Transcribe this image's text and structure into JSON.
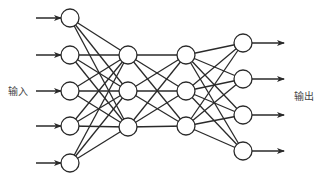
{
  "labels": {
    "input": "输入",
    "output": "输出"
  },
  "colors": {
    "stroke": "#2a2a2a",
    "node_fill": "#ffffff",
    "background": "#ffffff"
  },
  "network": {
    "node_radius": 9,
    "layers": [
      {
        "name": "input",
        "x": 70,
        "y": [
          18,
          55,
          91,
          126,
          163
        ]
      },
      {
        "name": "hidden-1",
        "x": 128,
        "y": [
          55,
          91,
          127
        ]
      },
      {
        "name": "hidden-2",
        "x": 186,
        "y": [
          55,
          91,
          126
        ]
      },
      {
        "name": "output",
        "x": 243,
        "y": [
          43,
          79,
          115,
          151
        ]
      }
    ],
    "input_arrows": {
      "x_start": 36,
      "x_end": 61
    },
    "output_arrows": {
      "x_start": 252,
      "x_end": 284
    }
  }
}
